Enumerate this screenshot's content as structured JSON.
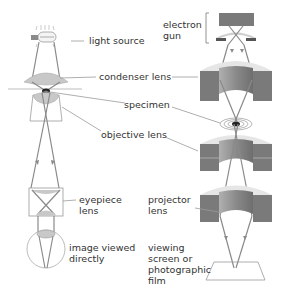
{
  "labels": {
    "light_source": "light source",
    "condenser_lens": "condenser lens",
    "specimen": "specimen",
    "objective_lens": "objective lens",
    "eyepiece_lens": "eyepiece\nlens",
    "image_viewed_directly": "image viewed\ndirectly",
    "electron_gun": "electron\ngun",
    "projector_lens": "projector\nlens",
    "viewing_screen": "viewing\nscreen or\nphotographic\nfilm"
  },
  "diagrams": [
    {
      "name": "light microscope",
      "components": [
        "light source",
        "condenser lens",
        "specimen",
        "objective lens",
        "eyepiece lens",
        "image viewed directly"
      ]
    },
    {
      "name": "electron microscope",
      "components": [
        "electron gun",
        "condenser lens",
        "specimen",
        "objective lens",
        "projector lens",
        "viewing screen or photographic film"
      ]
    }
  ],
  "colors": {
    "ray": "#8a8a8a",
    "lens_fill": "#c8c8c8",
    "magnet_dark": "#7a7a7a",
    "magnet_halo": "#e6e6e6",
    "specimen": "#222222",
    "leader_line": "#9a9a9a",
    "text": "#333333"
  }
}
